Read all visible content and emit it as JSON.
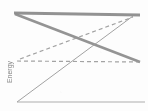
{
  "figure": {
    "background_color": "#fdfdfd",
    "width": 148,
    "height": 111,
    "y_axis_label": "Energy"
  },
  "chart_data": {
    "type": "line",
    "title": "",
    "subtitle": "",
    "xlabel": "",
    "ylabel": "Energy",
    "xlim": [
      0,
      148
    ],
    "ylim": [
      0,
      111
    ],
    "grid": false,
    "legend": "none",
    "axis_note": "No tick labels or numeric axis annotations are visible in the cropped figure.",
    "series": [
      {
        "name": "top-bold-horizontal",
        "style": "solid",
        "width": 3.2,
        "color": "#8a8a8a",
        "points": [
          [
            14,
            13
          ],
          [
            140,
            15
          ]
        ]
      },
      {
        "name": "bold-descending",
        "style": "solid",
        "width": 2.6,
        "color": "#8c8c8c",
        "points": [
          [
            15,
            14
          ],
          [
            140,
            62
          ]
        ]
      },
      {
        "name": "thin-ascending",
        "style": "solid",
        "width": 1.0,
        "color": "#9a9a9a",
        "points": [
          [
            17,
            102
          ],
          [
            133,
            16
          ]
        ]
      },
      {
        "name": "dashed-ascending",
        "style": "dashed",
        "width": 1.2,
        "color": "#9c9c9c",
        "points": [
          [
            20,
            59
          ],
          [
            133,
            17
          ]
        ]
      },
      {
        "name": "dashed-horizontal",
        "style": "dashed",
        "width": 1.2,
        "color": "#9c9c9c",
        "points": [
          [
            17,
            61
          ],
          [
            140,
            62
          ]
        ]
      },
      {
        "name": "bottom-baseline",
        "style": "solid",
        "width": 1.1,
        "color": "#a8a8a8",
        "points": [
          [
            17,
            102
          ],
          [
            145,
            102
          ]
        ]
      }
    ],
    "intersections": [
      {
        "name": "crossing-center",
        "x": 96,
        "y": 44
      },
      {
        "name": "crossing-left-dashed",
        "x": 61,
        "y": 56
      },
      {
        "name": "crossing-right-dashed",
        "x": 113,
        "y": 61
      }
    ]
  }
}
